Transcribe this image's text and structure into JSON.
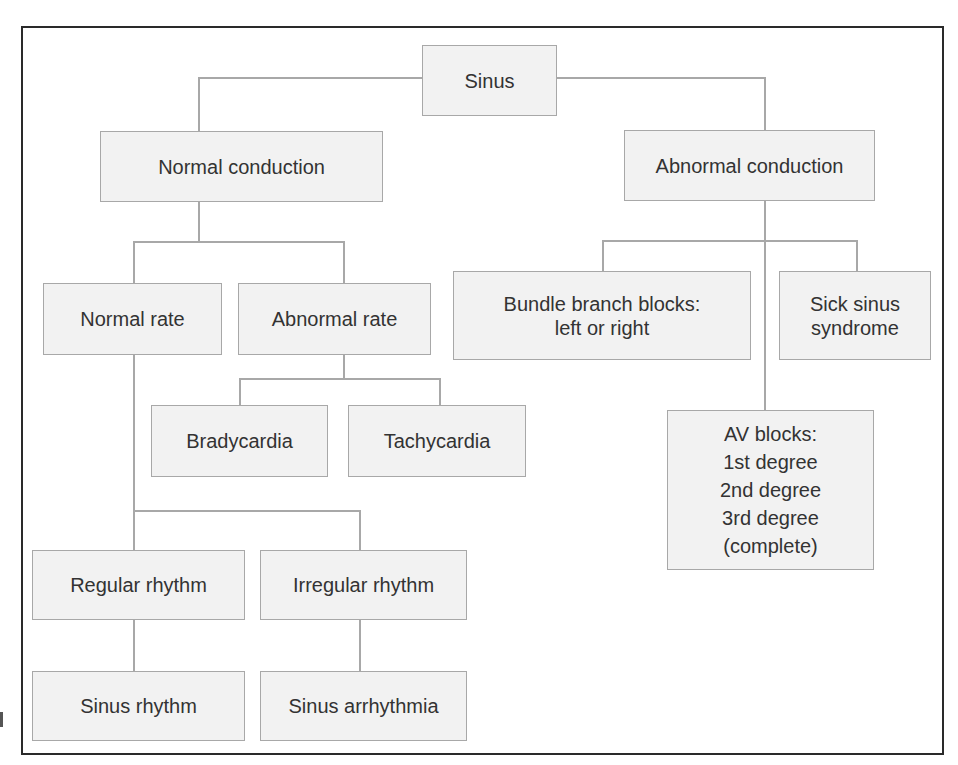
{
  "diagram": {
    "type": "tree",
    "root": "Sinus",
    "nodes": {
      "sinus": "Sinus",
      "normal_conduction": "Normal conduction",
      "abnormal_conduction": "Abnormal conduction",
      "normal_rate": "Normal rate",
      "abnormal_rate": "Abnormal rate",
      "bradycardia": "Bradycardia",
      "tachycardia": "Tachycardia",
      "regular_rhythm": "Regular rhythm",
      "irregular_rhythm": "Irregular rhythm",
      "sinus_rhythm": "Sinus rhythm",
      "sinus_arrhythmia": "Sinus arrhythmia",
      "bundle_branch_blocks": "Bundle branch blocks:\nleft or right",
      "sick_sinus_syndrome": "Sick sinus\nsyndrome",
      "av_blocks": "AV blocks:\n1st degree\n2nd degree\n3rd degree\n(complete)"
    },
    "edges": [
      [
        "Sinus",
        "Normal conduction"
      ],
      [
        "Sinus",
        "Abnormal conduction"
      ],
      [
        "Normal conduction",
        "Normal rate"
      ],
      [
        "Normal conduction",
        "Abnormal rate"
      ],
      [
        "Abnormal rate",
        "Bradycardia"
      ],
      [
        "Abnormal rate",
        "Tachycardia"
      ],
      [
        "Normal rate",
        "Regular rhythm"
      ],
      [
        "Normal rate",
        "Irregular rhythm"
      ],
      [
        "Regular rhythm",
        "Sinus rhythm"
      ],
      [
        "Irregular rhythm",
        "Sinus arrhythmia"
      ],
      [
        "Abnormal conduction",
        "Bundle branch blocks: left or right"
      ],
      [
        "Abnormal conduction",
        "Sick sinus syndrome"
      ],
      [
        "Abnormal conduction",
        "AV blocks: 1st degree, 2nd degree, 3rd degree (complete)"
      ]
    ],
    "colors": {
      "box_fill": "#f2f2f2",
      "box_border": "#a8a8a8",
      "line": "#a8a8a8",
      "frame": "#2a2a2a",
      "text": "#333333"
    }
  }
}
